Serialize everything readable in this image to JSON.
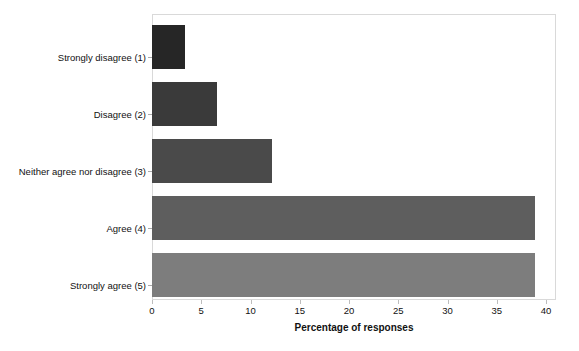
{
  "chart_data": {
    "type": "bar",
    "orientation": "horizontal",
    "title": "",
    "xlabel": "Percentage of responses",
    "ylabel": "",
    "categories": [
      "Strongly disagree (1)",
      "Disagree (2)",
      "Neither agree nor disagree (3)",
      "Agree (4)",
      "Strongly agree (5)"
    ],
    "values": [
      3.3,
      6.6,
      12.2,
      38.9,
      38.9
    ],
    "bar_colors": [
      "#262626",
      "#3a3a3a",
      "#4a4a4a",
      "#5e5e5e",
      "#7d7d7d"
    ],
    "xlim": [
      0,
      40
    ],
    "xticks": [
      0,
      5,
      10,
      15,
      20,
      25,
      30,
      35,
      40
    ],
    "xtick_labels": [
      "0",
      "5",
      "10",
      "15",
      "20",
      "25",
      "30",
      "35",
      "40"
    ],
    "grid": false,
    "legend": "none",
    "frame_color": "#d9d9d9",
    "background": "#ffffff"
  }
}
